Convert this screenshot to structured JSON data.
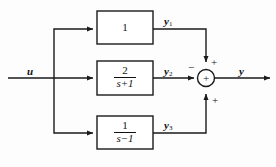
{
  "diagram": {
    "input": {
      "label": "u"
    },
    "output": {
      "label": "y"
    },
    "summing_junction": {
      "symbol": "+"
    },
    "blocks": [
      {
        "id": "block-1",
        "kind": "constant",
        "numerator": "1",
        "denominator": "",
        "display": "1",
        "output_label": "y",
        "output_subscript": "1",
        "sign_at_junction": "+"
      },
      {
        "id": "block-2",
        "kind": "fraction",
        "numerator": "2",
        "denominator": "s+1",
        "display": "2/(s+1)",
        "output_label": "y",
        "output_subscript": "2",
        "sign_at_junction": "−"
      },
      {
        "id": "block-3",
        "kind": "fraction",
        "numerator": "1",
        "denominator": "s−1",
        "display": "1/(s-1)",
        "output_label": "y",
        "output_subscript": "3",
        "sign_at_junction": "+"
      }
    ],
    "signs": {
      "top": "+",
      "middle": "−",
      "bottom": "+"
    },
    "colors": {
      "line": "#1a1a1a",
      "text": "#111111",
      "background": "#fdfdfd"
    }
  }
}
